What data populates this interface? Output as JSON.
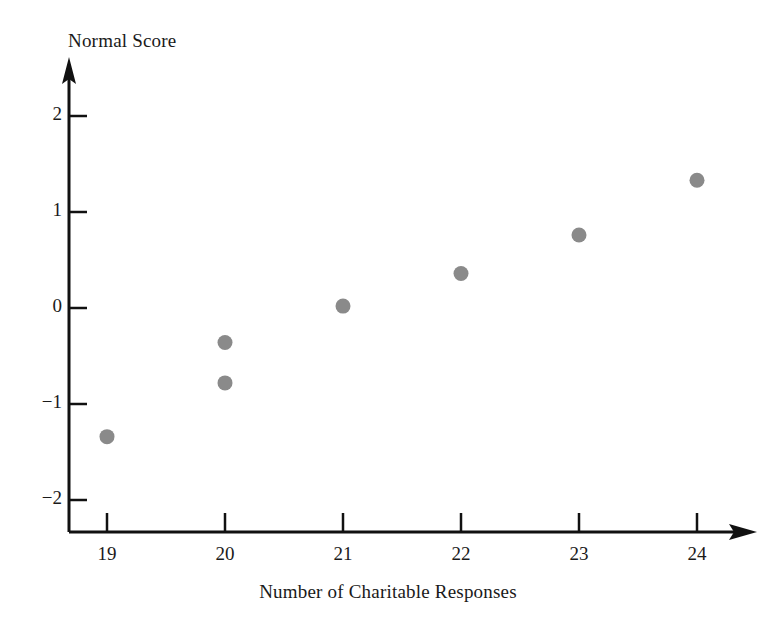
{
  "chart_data": {
    "type": "scatter",
    "title": "",
    "xlabel": "Number of Charitable Responses",
    "ylabel": "Normal Score",
    "x": [
      19,
      20,
      20,
      21,
      22,
      23,
      24
    ],
    "values": [
      -1.34,
      -0.36,
      -0.78,
      0.02,
      0.36,
      0.76,
      1.33
    ],
    "points": [
      {
        "x": 19,
        "y": -1.34
      },
      {
        "x": 20,
        "y": -0.36
      },
      {
        "x": 20,
        "y": -0.78
      },
      {
        "x": 21,
        "y": 0.02
      },
      {
        "x": 22,
        "y": 0.36
      },
      {
        "x": 23,
        "y": 0.76
      },
      {
        "x": 24,
        "y": 1.33
      }
    ],
    "xlim": [
      18.5,
      24.5
    ],
    "ylim": [
      -2.4,
      2.4
    ],
    "x_ticks": [
      19,
      20,
      21,
      22,
      23,
      24
    ],
    "y_ticks": [
      2,
      1,
      0,
      -1,
      -2
    ],
    "x_tick_labels": [
      "19",
      "20",
      "21",
      "22",
      "23",
      "24"
    ],
    "y_tick_labels": [
      "2",
      "1",
      "0",
      "−1",
      "−2"
    ],
    "grid": false,
    "legend": false,
    "marker": "circle",
    "marker_color": "#8a8a8a",
    "axis_color": "#111111",
    "background": "#ffffff",
    "axis_arrows": {
      "x": "right",
      "y": "up"
    }
  },
  "axes": {
    "y_title": "Normal Score",
    "x_title": "Number of Charitable Responses"
  }
}
